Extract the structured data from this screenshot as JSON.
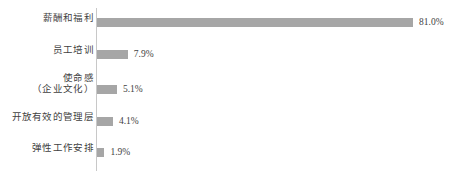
{
  "chart_data": {
    "type": "bar",
    "orientation": "horizontal",
    "title": "",
    "subtitle": "",
    "xlabel": "",
    "ylabel": "",
    "grid": false,
    "legend": false,
    "legend_position": "none",
    "axis_line": "vertical-left",
    "xlim": [
      0,
      81
    ],
    "bar_color": "#a6a6a6",
    "value_suffix": "%",
    "categories": [
      "薪酬和福利",
      "员工培训",
      "使命感\n（企业文化）",
      "开放有效的管理层",
      "弹性工作安排"
    ],
    "values": [
      81.0,
      7.9,
      5.1,
      4.1,
      1.9
    ],
    "value_labels": [
      "81.0%",
      "7.9%",
      "5.1%",
      "4.1%",
      "1.9%"
    ],
    "points": [
      {
        "category_line1": "薪酬和福利",
        "category_line2": "",
        "value": 81.0,
        "value_label": "81.0%"
      },
      {
        "category_line1": "员工培训",
        "category_line2": "",
        "value": 7.9,
        "value_label": "7.9%"
      },
      {
        "category_line1": "使命感",
        "category_line2": "（企业文化）",
        "value": 5.1,
        "value_label": "5.1%"
      },
      {
        "category_line1": "开放有效的管理层",
        "category_line2": "",
        "value": 4.1,
        "value_label": "4.1%"
      },
      {
        "category_line1": "弹性工作安排",
        "category_line2": "",
        "value": 1.9,
        "value_label": "1.9%"
      }
    ]
  }
}
